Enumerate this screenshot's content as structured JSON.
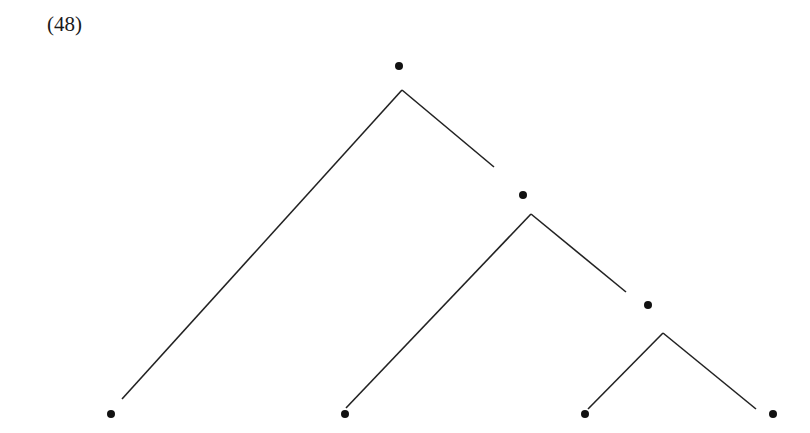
{
  "example_number": "(48)",
  "tree": {
    "type": "binary-branching-tree",
    "nodes": [
      {
        "id": "root",
        "x": 399,
        "y": 66
      },
      {
        "id": "node2",
        "x": 523,
        "y": 195
      },
      {
        "id": "node3",
        "x": 648,
        "y": 305
      },
      {
        "id": "leaf1",
        "x": 111,
        "y": 414
      },
      {
        "id": "leaf2",
        "x": 345,
        "y": 414
      },
      {
        "id": "leaf3",
        "x": 585,
        "y": 414
      },
      {
        "id": "leaf4",
        "x": 773,
        "y": 414
      }
    ],
    "branches": [
      {
        "from": [
          402,
          90
        ],
        "to": [
          122,
          399
        ]
      },
      {
        "from": [
          402,
          90
        ],
        "to": [
          494,
          167
        ]
      },
      {
        "from": [
          531,
          214
        ],
        "to": [
          346,
          408
        ]
      },
      {
        "from": [
          531,
          214
        ],
        "to": [
          626,
          292
        ]
      },
      {
        "from": [
          663,
          333
        ],
        "to": [
          588,
          409
        ]
      },
      {
        "from": [
          663,
          333
        ],
        "to": [
          756,
          409
        ]
      }
    ],
    "line_color": "#222222",
    "dot_color": "#111111"
  }
}
